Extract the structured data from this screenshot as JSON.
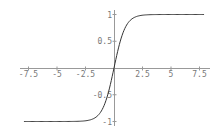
{
  "chart_data": {
    "type": "line",
    "title": "",
    "xlabel": "",
    "ylabel": "",
    "function": "tanh(x)",
    "xlim": [
      -8,
      8
    ],
    "ylim": [
      -1,
      1
    ],
    "grid": false,
    "x_ticks": [
      -7.5,
      -5,
      -2.5,
      2.5,
      5,
      7.5
    ],
    "x_tick_labels": [
      "-7.5",
      "-5",
      "-2.5",
      "2.5",
      "5",
      "7.5"
    ],
    "y_ticks": [
      -1,
      -0.5,
      0.5,
      1
    ],
    "y_tick_labels": [
      "-1",
      "-0.5",
      "0.5",
      "1"
    ],
    "series": [
      {
        "name": "tanh",
        "x": [
          -8,
          -6,
          -4,
          -3,
          -2,
          -1.5,
          -1,
          -0.5,
          0,
          0.5,
          1,
          1.5,
          2,
          3,
          4,
          6,
          8
        ],
        "y": [
          -1.0,
          -1.0,
          -0.999,
          -0.995,
          -0.964,
          -0.905,
          -0.762,
          -0.462,
          0,
          0.462,
          0.762,
          0.905,
          0.964,
          0.995,
          0.999,
          1.0,
          1.0
        ]
      }
    ],
    "colors": {
      "curve": "#333333",
      "axis": "#999999",
      "labels": "#777777"
    }
  }
}
